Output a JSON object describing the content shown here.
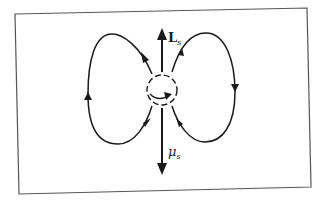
{
  "diagram": {
    "labels": {
      "angular_momentum": "L",
      "angular_momentum_sub": "s",
      "magnetic_moment": "μ",
      "magnetic_moment_sub": "s"
    },
    "colors": {
      "stroke": "#1a1a1a",
      "frame": "#555555",
      "background": "#ffffff"
    }
  }
}
